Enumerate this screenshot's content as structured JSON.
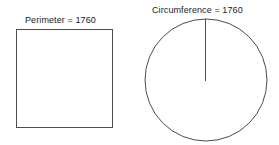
{
  "figure": {
    "background_color": "#ffffff",
    "stroke_color": "#4d4d4d",
    "text_color": "#1a1a1a",
    "width": 279,
    "height": 145,
    "shapes": {
      "square": {
        "name": "square",
        "label": "Perimeter = 1760",
        "value": 1760,
        "measure_name": "Perimeter",
        "x": 16,
        "y": 29,
        "width": 96,
        "height": 98,
        "fill": "none",
        "stroke_width": 1
      },
      "circle": {
        "name": "circle",
        "label": "Circumference = 1760",
        "value": 1760,
        "measure_name": "Circumference",
        "center_x": 206,
        "center_y": 80,
        "radius": 61,
        "fill": "none",
        "stroke_width": 1,
        "radius_line": {
          "name": "radius-line",
          "x1": 206,
          "y1": 19,
          "x2": 206,
          "y2": 80,
          "stroke_width": 1
        }
      }
    }
  }
}
